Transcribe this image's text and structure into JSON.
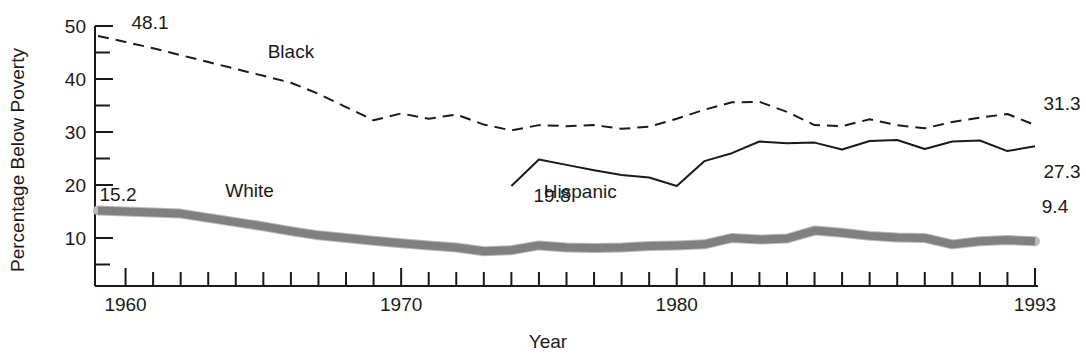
{
  "chart_data": {
    "type": "line",
    "title": "",
    "xlabel": "Year",
    "ylabel": "Percentage Below Poverty",
    "xlim": [
      1959,
      1993
    ],
    "ylim": [
      3,
      50
    ],
    "grid": false,
    "legend": "inline-labels",
    "y_major_ticks": [
      10,
      20,
      30,
      40,
      50
    ],
    "y_minor_ticks": [
      5,
      15,
      25,
      35,
      45
    ],
    "y_tick_labels": [
      "10",
      "20",
      "30",
      "40",
      "50"
    ],
    "x_major_ticks": [
      1960,
      1970,
      1980,
      1993
    ],
    "x_tick_labels": [
      "1960",
      "1970",
      "1980",
      "1993"
    ],
    "x_minor_tick_interval": 1,
    "series": [
      {
        "name": "Black",
        "label": "Black",
        "style": "dashed",
        "color": "#1a1a1a",
        "width": 2,
        "label_x": 1966.0,
        "label_y": 44.0,
        "start_label": "48.1",
        "end_label": "31.3",
        "x": [
          1959,
          1960,
          1961,
          1962,
          1963,
          1964,
          1965,
          1966,
          1967,
          1968,
          1969,
          1970,
          1971,
          1972,
          1973,
          1974,
          1975,
          1976,
          1977,
          1978,
          1979,
          1980,
          1981,
          1982,
          1983,
          1984,
          1985,
          1986,
          1987,
          1988,
          1989,
          1990,
          1991,
          1992,
          1993
        ],
        "values": [
          48.1,
          47.0,
          45.8,
          44.5,
          43.2,
          41.9,
          40.6,
          39.3,
          37.2,
          34.7,
          32.2,
          33.5,
          32.5,
          33.3,
          31.4,
          30.3,
          31.3,
          31.1,
          31.3,
          30.6,
          31.0,
          32.5,
          34.2,
          35.6,
          35.7,
          33.8,
          31.3,
          31.1,
          32.4,
          31.3,
          30.7,
          31.9,
          32.7,
          33.4,
          31.3
        ]
      },
      {
        "name": "Hispanic",
        "label": "Hispanic",
        "style": "solid",
        "color": "#1a1a1a",
        "width": 2,
        "label_x": 1976.5,
        "label_y": 17.5,
        "start_label": "19.8",
        "end_label": "27.3",
        "x": [
          1974,
          1975,
          1976,
          1977,
          1978,
          1979,
          1980,
          1981,
          1982,
          1983,
          1984,
          1985,
          1986,
          1987,
          1988,
          1989,
          1990,
          1991,
          1992,
          1993
        ],
        "values": [
          19.8,
          24.8,
          23.8,
          22.8,
          21.9,
          21.4,
          19.8,
          24.5,
          26.0,
          28.2,
          27.9,
          28.0,
          26.7,
          28.3,
          28.5,
          26.8,
          28.2,
          28.4,
          26.4,
          27.3
        ]
      },
      {
        "name": "White",
        "label": "White",
        "style": "solid",
        "color": "#808080",
        "width": 8,
        "label_x": 1964.5,
        "label_y": 17.8,
        "start_label": "15.2",
        "end_label": "9.4",
        "x": [
          1959,
          1960,
          1961,
          1962,
          1963,
          1964,
          1965,
          1966,
          1967,
          1968,
          1969,
          1970,
          1971,
          1972,
          1973,
          1974,
          1975,
          1976,
          1977,
          1978,
          1979,
          1980,
          1981,
          1982,
          1983,
          1984,
          1985,
          1986,
          1987,
          1988,
          1989,
          1990,
          1991,
          1992,
          1993
        ],
        "values": [
          15.2,
          15.0,
          14.8,
          14.6,
          13.8,
          13.0,
          12.2,
          11.3,
          10.5,
          10.0,
          9.5,
          9.0,
          8.6,
          8.2,
          7.5,
          7.7,
          8.6,
          8.2,
          8.1,
          8.2,
          8.5,
          8.6,
          8.8,
          10.0,
          9.7,
          9.9,
          11.4,
          11.0,
          10.4,
          10.1,
          10.0,
          8.8,
          9.4,
          9.6,
          9.4
        ]
      }
    ]
  },
  "axis": {
    "ylabel": "Percentage Below Poverty",
    "xlabel": "Year"
  }
}
